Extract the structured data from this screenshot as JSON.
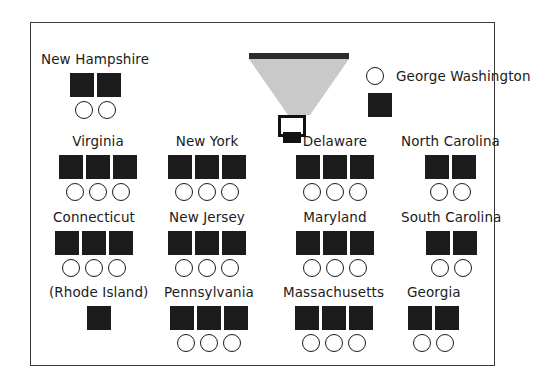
{
  "figure": {
    "title": "",
    "frame_color": "#3a3a3a",
    "background": "#ffffff",
    "square_color": "#1c1c1c",
    "circle_outline_color": "#1b1b1b",
    "drape_color": "#c9c9c9",
    "canopy_color": "#2b2b2b"
  },
  "podium": {
    "canopy_name": "canopy-bar",
    "drape_name": "canopy-drape",
    "lectern_name": "lectern",
    "lectern_base_name": "lectern-base"
  },
  "legend": {
    "label": "George Washington",
    "circle_icon": "open-circle-icon",
    "square_icon": "filled-square-icon"
  },
  "chart_data": {
    "type": "table",
    "title": "",
    "xlabel": "",
    "ylabel": "",
    "legend": [
      "George Washington"
    ],
    "symbols": {
      "square": "filled black square",
      "circle": "open circle"
    },
    "categories": [
      "New Hampshire",
      "Virginia",
      "New York",
      "Delaware",
      "North Carolina",
      "Connecticut",
      "New Jersey",
      "Maryland",
      "South Carolina",
      "(Rhode Island)",
      "Pennsylvania",
      "Massachusetts",
      "Georgia"
    ],
    "series": [
      {
        "name": "squares",
        "values": [
          2,
          3,
          3,
          3,
          2,
          3,
          3,
          3,
          2,
          1,
          3,
          3,
          2
        ]
      },
      {
        "name": "circles",
        "values": [
          2,
          3,
          3,
          3,
          2,
          3,
          3,
          3,
          2,
          0,
          3,
          3,
          2
        ]
      }
    ]
  },
  "groups": [
    {
      "label": "New Hampshire",
      "squares": 2,
      "circles": 2
    },
    {
      "label": "Virginia",
      "squares": 3,
      "circles": 3
    },
    {
      "label": "New York",
      "squares": 3,
      "circles": 3
    },
    {
      "label": "Delaware",
      "squares": 3,
      "circles": 3
    },
    {
      "label": "North Carolina",
      "squares": 2,
      "circles": 2
    },
    {
      "label": "Connecticut",
      "squares": 3,
      "circles": 3
    },
    {
      "label": "New Jersey",
      "squares": 3,
      "circles": 3
    },
    {
      "label": "Maryland",
      "squares": 3,
      "circles": 3
    },
    {
      "label": "South Carolina",
      "squares": 2,
      "circles": 2
    },
    {
      "label": "(Rhode Island)",
      "squares": 1,
      "circles": 0
    },
    {
      "label": "Pennsylvania",
      "squares": 3,
      "circles": 3
    },
    {
      "label": "Massachusetts",
      "squares": 3,
      "circles": 3
    },
    {
      "label": "Georgia",
      "squares": 2,
      "circles": 2
    }
  ]
}
